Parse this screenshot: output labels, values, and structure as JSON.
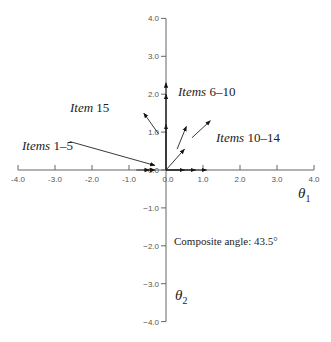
{
  "diagram": {
    "type": "vector-plot",
    "origin_px": [
      166,
      170
    ],
    "px_per_unit": 37.5,
    "x_axis": {
      "title_symbol": "θ",
      "title_subscript": "1",
      "ticks": [
        {
          "value": -4.0,
          "label": "-4.0"
        },
        {
          "value": -3.0,
          "label": "-3.0"
        },
        {
          "value": -2.0,
          "label": "-2.0"
        },
        {
          "value": -1.0,
          "label": "-1.0"
        },
        {
          "value": 0.0,
          "label": "0.0"
        },
        {
          "value": 1.0,
          "label": "1.0"
        },
        {
          "value": 2.0,
          "label": "2.0"
        },
        {
          "value": 3.0,
          "label": "3.0"
        },
        {
          "value": 4.0,
          "label": "4.0"
        }
      ]
    },
    "y_axis": {
      "title_symbol": "θ",
      "title_subscript": "2",
      "ticks": [
        {
          "value": 4.0,
          "label": "4.0"
        },
        {
          "value": 3.0,
          "label": "3.0"
        },
        {
          "value": 2.0,
          "label": "2.0"
        },
        {
          "value": 1.0,
          "label": "1.0"
        },
        {
          "value": 0.0,
          "label": "0.0"
        },
        {
          "value": -1.0,
          "label": "−1.0"
        },
        {
          "value": -2.0,
          "label": "−2.0"
        },
        {
          "value": -3.0,
          "label": "−3.0"
        },
        {
          "value": -4.0,
          "label": "−4.0"
        }
      ]
    },
    "labels": [
      {
        "id": "items-1-5",
        "italic": "Items",
        "rest": " 1–5"
      },
      {
        "id": "item-15",
        "italic": "Item",
        "rest": " 15"
      },
      {
        "id": "items-6-10",
        "italic": "Items",
        "rest": " 6–10"
      },
      {
        "id": "items-10-14",
        "italic": "Items",
        "rest": " 10–14"
      }
    ],
    "composite_angle_text": "Composite angle: 43.5°",
    "vectors": [
      {
        "group": "items-1-5",
        "from": [
          -0.8,
          0.0
        ],
        "to": [
          -0.45,
          0.0
        ]
      },
      {
        "group": "items-1-5",
        "from": [
          -0.6,
          0.0
        ],
        "to": [
          -0.3,
          0.0
        ]
      },
      {
        "group": "items-6-10",
        "from": [
          0.0,
          0.0
        ],
        "to": [
          0.0,
          1.2
        ]
      },
      {
        "group": "items-6-10",
        "from": [
          0.0,
          0.0
        ],
        "to": [
          0.0,
          2.0
        ]
      },
      {
        "group": "items-6-10",
        "from": [
          0.0,
          0.0
        ],
        "to": [
          0.0,
          2.3
        ]
      },
      {
        "group": "items-11-14",
        "from": [
          0.0,
          0.0
        ],
        "to": [
          0.5,
          0.55
        ]
      },
      {
        "group": "items-11-14",
        "from": [
          0.3,
          0.55
        ],
        "to": [
          0.55,
          1.15
        ]
      },
      {
        "group": "items-11-14",
        "from": [
          0.7,
          0.85
        ],
        "to": [
          1.2,
          1.3
        ]
      },
      {
        "group": "items-1-5-h",
        "from": [
          0.0,
          0.0
        ],
        "to": [
          0.5,
          0.0
        ]
      },
      {
        "group": "items-1-5-h",
        "from": [
          0.0,
          0.0
        ],
        "to": [
          0.8,
          0.0
        ]
      },
      {
        "group": "items-1-5-h",
        "from": [
          0.0,
          0.0
        ],
        "to": [
          1.1,
          0.0
        ]
      },
      {
        "group": "item-15",
        "from": [
          -0.2,
          0.95
        ],
        "to": [
          -0.6,
          1.5
        ]
      }
    ],
    "callout_lines": [
      {
        "label": "items-1-5",
        "from": [
          -2.6,
          0.75
        ],
        "to": [
          -0.3,
          0.12
        ]
      }
    ]
  }
}
